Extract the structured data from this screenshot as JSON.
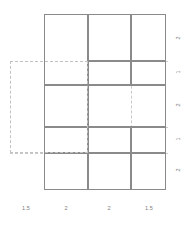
{
  "figure": {
    "type": "rectangle-packing-diagram",
    "background": "#ffffff",
    "cell_stroke": "#8a8a8a",
    "guide_stroke": "#c9c9c9",
    "label_color": "#7d7d7d"
  },
  "chart_data": {
    "type": "table",
    "title": "",
    "xlabel": "",
    "ylabel": "",
    "grid": true,
    "legend": "none",
    "column_widths": [
      1.5,
      2,
      2,
      1.5
    ],
    "row_heights": [
      2,
      1,
      2,
      1,
      2
    ],
    "x_tick_labels": [
      "1.5",
      "2",
      "2",
      "1.5"
    ],
    "y_tick_labels": [
      "2",
      "1",
      "2",
      "1",
      "2"
    ],
    "cells": [
      {
        "id": "cell-1",
        "col": 0,
        "row": 0,
        "x": 44,
        "y": 14,
        "w": 44,
        "h": 71
      },
      {
        "id": "cell-2",
        "col": 1,
        "row": 0,
        "x": 88,
        "y": 14,
        "w": 43,
        "h": 47
      },
      {
        "id": "cell-3",
        "col": 2,
        "row": 0,
        "x": 131,
        "y": 14,
        "w": 35,
        "h": 47
      },
      {
        "id": "cell-4",
        "col": 1,
        "row": 1,
        "x": 88,
        "y": 61,
        "w": 43,
        "h": 24
      },
      {
        "id": "cell-5",
        "col": 2,
        "row": 1,
        "x": 131,
        "y": 61,
        "w": 35,
        "h": 24
      },
      {
        "id": "cell-6",
        "col": 0,
        "row": 2,
        "x": 44,
        "y": 85,
        "w": 44,
        "h": 42
      },
      {
        "id": "cell-7",
        "col": 1,
        "row": 2,
        "x": 88,
        "y": 85,
        "w": 78,
        "h": 42
      },
      {
        "id": "cell-8",
        "col": 0,
        "row": 3,
        "x": 44,
        "y": 127,
        "w": 44,
        "h": 26
      },
      {
        "id": "cell-9",
        "col": 1,
        "row": 3,
        "x": 88,
        "y": 127,
        "w": 43,
        "h": 26
      },
      {
        "id": "cell-10",
        "col": 2,
        "row": 3,
        "x": 131,
        "y": 127,
        "w": 35,
        "h": 26
      },
      {
        "id": "cell-11",
        "col": 0,
        "row": 4,
        "x": 44,
        "y": 153,
        "w": 44,
        "h": 37
      },
      {
        "id": "cell-12",
        "col": 1,
        "row": 4,
        "x": 88,
        "y": 153,
        "w": 43,
        "h": 37
      },
      {
        "id": "cell-13",
        "col": 2,
        "row": 4,
        "x": 131,
        "y": 153,
        "w": 35,
        "h": 37
      }
    ],
    "guides": {
      "selection_rect": {
        "x": 10,
        "y": 61,
        "w": 78,
        "h": 92
      },
      "h_lines": [
        {
          "x": 88,
          "y": 61,
          "w": 80
        },
        {
          "x": 88,
          "y": 127,
          "w": 80
        },
        {
          "x": 10,
          "y": 153,
          "w": 158
        }
      ],
      "v_lines": [
        {
          "x": 88,
          "y": 85,
          "h": 68
        },
        {
          "x": 131,
          "y": 61,
          "h": 92
        }
      ]
    },
    "x_ticks_px": [
      44,
      88,
      131,
      166
    ],
    "y_ticks_px": [
      14,
      61,
      85,
      127,
      153,
      190
    ]
  },
  "labels": {
    "x": [
      {
        "text": "1.5",
        "cx": 26,
        "y": 205
      },
      {
        "text": "2",
        "cx": 66,
        "y": 205
      },
      {
        "text": "2",
        "cx": 109,
        "y": 205
      },
      {
        "text": "1.5",
        "cx": 149,
        "y": 205
      }
    ],
    "y": [
      {
        "text": "2",
        "cy": 39,
        "x": 178
      },
      {
        "text": "1",
        "cy": 73,
        "x": 178
      },
      {
        "text": "2",
        "cy": 106,
        "x": 178
      },
      {
        "text": "1",
        "cy": 140,
        "x": 178
      },
      {
        "text": "2",
        "cy": 171,
        "x": 178
      }
    ]
  }
}
